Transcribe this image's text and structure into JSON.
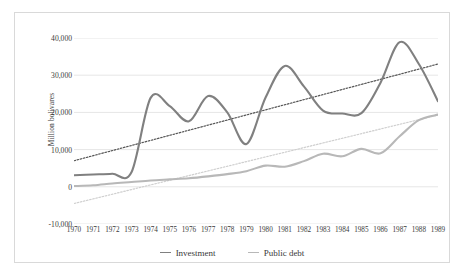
{
  "chart_data": {
    "type": "line",
    "title": "",
    "xlabel": "",
    "ylabel": "Million bolivares",
    "x": [
      1970,
      1971,
      1972,
      1973,
      1974,
      1975,
      1976,
      1977,
      1978,
      1979,
      1980,
      1981,
      1982,
      1983,
      1984,
      1985,
      1986,
      1987,
      1988,
      1989
    ],
    "xtick_labels": [
      "1970",
      "1971",
      "1972",
      "1973",
      "1974",
      "1975",
      "1976",
      "1977",
      "1978",
      "1979",
      "1980",
      "1981",
      "1982",
      "1983",
      "1984",
      "1985",
      "1986",
      "1987",
      "1988",
      "1989"
    ],
    "ylim": [
      -10000,
      40000
    ],
    "ytick_values": [
      40000,
      30000,
      20000,
      10000,
      0,
      -10000
    ],
    "ytick_labels": [
      "40,000",
      "30,000",
      "20,000",
      "10,000",
      "0",
      "-10,000"
    ],
    "grid": "horizontal",
    "legend_position": "bottom-center",
    "series": [
      {
        "name": "Investment",
        "color": "#808080",
        "style": "solid",
        "values": [
          3100,
          3300,
          3500,
          3900,
          23900,
          21700,
          17600,
          24400,
          20000,
          11500,
          24000,
          32500,
          27000,
          20500,
          19700,
          19800,
          28000,
          38900,
          33000,
          23000
        ]
      },
      {
        "name": "Public debt",
        "color": "#b8b8b8",
        "style": "solid",
        "values": [
          200,
          400,
          900,
          1300,
          1700,
          2000,
          2300,
          2800,
          3400,
          4200,
          5700,
          5400,
          6900,
          8900,
          8200,
          10200,
          9000,
          13600,
          17900,
          19400
        ]
      },
      {
        "name": "Investment trendline",
        "color": "#555555",
        "style": "dotted",
        "trend_from": 7000,
        "trend_to": 33000
      },
      {
        "name": "Public debt trendline",
        "color": "#cfcfcf",
        "style": "dotted",
        "trend_from": -4500,
        "trend_to": 19300
      }
    ],
    "legend": [
      "Investment",
      "Public debt"
    ]
  },
  "legend": {
    "investment_label": "Investment",
    "public_debt_label": "Public debt"
  }
}
